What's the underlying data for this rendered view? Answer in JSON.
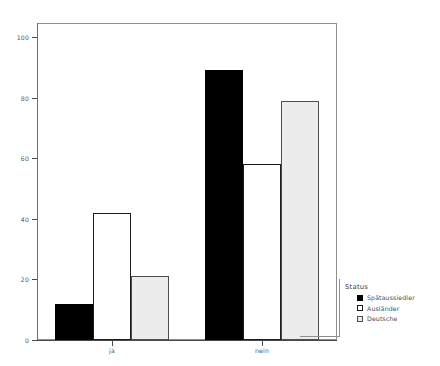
{
  "chart_data": {
    "type": "bar",
    "title": "",
    "subtitle": "",
    "xlabel": "",
    "ylabel": "",
    "categories": [
      "ja",
      "nein"
    ],
    "series": [
      {
        "name": "Spätaussiedler",
        "values": [
          12,
          89
        ],
        "color": "#000000",
        "swatch": "fill-black"
      },
      {
        "name": "Ausländer",
        "values": [
          42,
          58
        ],
        "color": "#ffffff",
        "swatch": "fill-white"
      },
      {
        "name": "Deutsche",
        "values": [
          21,
          79
        ],
        "color": "#ececec",
        "swatch": "fill-gray"
      }
    ],
    "ylim": [
      0,
      105
    ],
    "yticks": [
      0,
      20,
      40,
      60,
      80,
      100
    ],
    "ytick_labels": [
      "0",
      "20",
      "40",
      "60",
      "80",
      "100"
    ],
    "grid": false,
    "legend": {
      "title": "Status",
      "position": "right"
    }
  },
  "legend": {
    "title": "Status",
    "items": [
      {
        "label": "Spätaussiedler"
      },
      {
        "label": "Ausländer"
      },
      {
        "label": "Deutsche"
      }
    ]
  },
  "axes": {
    "y_labels": [
      "100",
      "80",
      "60",
      "40",
      "20",
      "0"
    ],
    "x_labels": [
      "ja",
      "nein"
    ]
  }
}
